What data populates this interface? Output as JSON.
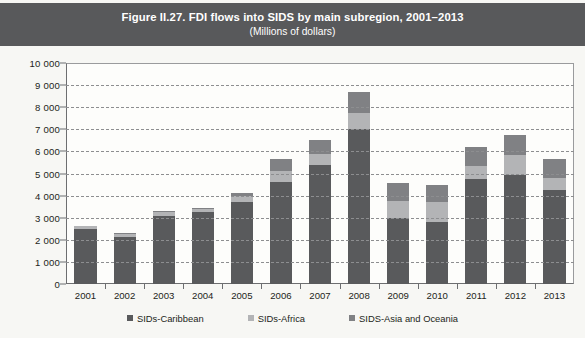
{
  "title": {
    "main": "Figure II.27. FDI flows into SIDS by main subregion, 2001–2013",
    "sub": "(Millions of dollars)"
  },
  "colors": {
    "band": "#58595b",
    "caribbean": "#595a5c",
    "africa": "#b3b4b6",
    "asia": "#808184",
    "plot_bg": "#fdfdfb",
    "page_bg": "#f7f7f4",
    "grid": "#8d8e90"
  },
  "legend": {
    "position": "bottom",
    "items": [
      {
        "label": "SIDs-Caribbean",
        "key": "caribbean"
      },
      {
        "label": "SIDs-Africa",
        "key": "africa"
      },
      {
        "label": "SIDS-Asia and Oceania",
        "key": "asia"
      }
    ]
  },
  "axes": {
    "y_ticks": [
      "0",
      "1 000",
      "2 000",
      "3 000",
      "4 000",
      "5 000",
      "6 000",
      "7 000",
      "8 000",
      "9 000",
      "10 000"
    ],
    "y_tick_values": [
      0,
      1000,
      2000,
      3000,
      4000,
      5000,
      6000,
      7000,
      8000,
      9000,
      10000
    ],
    "ylim": [
      0,
      10000
    ],
    "grid": true
  },
  "chart_data": {
    "type": "bar",
    "stacked": true,
    "title": "Figure II.27. FDI flows into SIDS by main subregion, 2001–2013",
    "subtitle": "(Millions of dollars)",
    "xlabel": "",
    "ylabel": "",
    "ylim": [
      0,
      10000
    ],
    "categories": [
      "2001",
      "2002",
      "2003",
      "2004",
      "2005",
      "2006",
      "2007",
      "2008",
      "2009",
      "2010",
      "2011",
      "2012",
      "2013"
    ],
    "series": [
      {
        "name": "SIDs-Caribbean",
        "values": [
          2480,
          2150,
          3100,
          3250,
          3700,
          4600,
          5400,
          7000,
          3000,
          2800,
          4750,
          4950,
          4250
        ]
      },
      {
        "name": "SIDs-Africa",
        "values": [
          130,
          120,
          160,
          130,
          300,
          500,
          500,
          750,
          750,
          900,
          600,
          900,
          550
        ]
      },
      {
        "name": "SIDS-Asia and Oceania",
        "values": [
          30,
          30,
          60,
          40,
          120,
          570,
          600,
          950,
          800,
          800,
          850,
          900,
          850
        ]
      }
    ],
    "totals": [
      2640,
      2300,
      3320,
      3420,
      4120,
      5670,
      6500,
      8700,
      4550,
      4500,
      6200,
      6750,
      5650
    ]
  }
}
